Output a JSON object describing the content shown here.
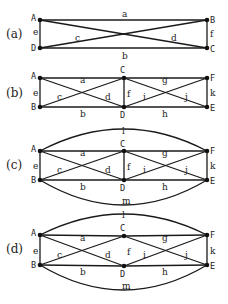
{
  "colors": {
    "stroke": "#1a1a1a",
    "node": "#111111",
    "text": "#222222",
    "background": "#ffffff"
  },
  "panels": [
    {
      "id": "a",
      "label": "(a)",
      "label_pos": [
        6,
        38
      ],
      "nodes": [
        {
          "name": "A",
          "x": 40,
          "y": 20,
          "lx": 31,
          "ly": 21
        },
        {
          "name": "B",
          "x": 207,
          "y": 20,
          "lx": 210,
          "ly": 23
        },
        {
          "name": "C",
          "x": 207,
          "y": 48,
          "lx": 210,
          "ly": 52
        },
        {
          "name": "D",
          "x": 40,
          "y": 48,
          "lx": 31,
          "ly": 51
        }
      ],
      "edges": [
        {
          "label": "a",
          "from": "A",
          "to": "B",
          "lx": 122,
          "ly": 17
        },
        {
          "label": "b",
          "from": "D",
          "to": "C",
          "lx": 122,
          "ly": 59
        },
        {
          "label": "c",
          "from": "D",
          "to": "B",
          "lx": 75,
          "ly": 41
        },
        {
          "label": "d",
          "from": "A",
          "to": "C",
          "lx": 171,
          "ly": 41
        },
        {
          "label": "e",
          "from": "A",
          "to": "D",
          "lx": 33,
          "ly": 35
        },
        {
          "label": "f",
          "from": "B",
          "to": "C",
          "lx": 210,
          "ly": 37
        }
      ]
    },
    {
      "id": "b",
      "label": "(b)",
      "label_pos": [
        6,
        97
      ],
      "nodes": [
        {
          "name": "A",
          "x": 40,
          "y": 78,
          "lx": 31,
          "ly": 79
        },
        {
          "name": "C",
          "x": 124,
          "y": 78,
          "lx": 120,
          "ly": 73
        },
        {
          "name": "F",
          "x": 207,
          "y": 78,
          "lx": 210,
          "ly": 81
        },
        {
          "name": "B",
          "x": 40,
          "y": 107,
          "lx": 31,
          "ly": 110
        },
        {
          "name": "D",
          "x": 124,
          "y": 107,
          "lx": 120,
          "ly": 118
        },
        {
          "name": "E",
          "x": 207,
          "y": 107,
          "lx": 210,
          "ly": 111
        }
      ],
      "edges": [
        {
          "label": "a",
          "from": "A",
          "to": "C",
          "lx": 80,
          "ly": 83
        },
        {
          "label": "b",
          "from": "B",
          "to": "D",
          "lx": 80,
          "ly": 117
        },
        {
          "label": "c",
          "from": "B",
          "to": "C",
          "lx": 57,
          "ly": 100
        },
        {
          "label": "d",
          "from": "A",
          "to": "D",
          "lx": 105,
          "ly": 100
        },
        {
          "label": "e",
          "from": "A",
          "to": "B",
          "lx": 33,
          "ly": 96
        },
        {
          "label": "f",
          "from": "C",
          "to": "D",
          "lx": 127,
          "ly": 97
        },
        {
          "label": "g",
          "from": "C",
          "to": "F",
          "lx": 162,
          "ly": 83
        },
        {
          "label": "h",
          "from": "D",
          "to": "E",
          "lx": 162,
          "ly": 117
        },
        {
          "label": "i",
          "from": "D",
          "to": "F",
          "lx": 143,
          "ly": 100
        },
        {
          "label": "j",
          "from": "C",
          "to": "E",
          "lx": 185,
          "ly": 100
        },
        {
          "label": "k",
          "from": "F",
          "to": "E",
          "lx": 210,
          "ly": 96
        }
      ]
    },
    {
      "id": "c",
      "label": "(c)",
      "label_pos": [
        6,
        169
      ],
      "arc_top": {
        "label": "l",
        "peak_y": 129,
        "lx": 122,
        "ly": 134
      },
      "arc_bottom": {
        "label": "m",
        "trough_y": 205,
        "lx": 122,
        "ly": 204
      },
      "nodes": [
        {
          "name": "A",
          "x": 40,
          "y": 151,
          "lx": 31,
          "ly": 152
        },
        {
          "name": "C",
          "x": 124,
          "y": 151,
          "lx": 120,
          "ly": 147
        },
        {
          "name": "F",
          "x": 207,
          "y": 151,
          "lx": 210,
          "ly": 154
        },
        {
          "name": "B",
          "x": 40,
          "y": 180,
          "lx": 31,
          "ly": 183
        },
        {
          "name": "D",
          "x": 124,
          "y": 180,
          "lx": 120,
          "ly": 191
        },
        {
          "name": "E",
          "x": 207,
          "y": 180,
          "lx": 210,
          "ly": 184
        }
      ],
      "edges": [
        {
          "label": "a",
          "from": "A",
          "to": "C",
          "lx": 80,
          "ly": 156
        },
        {
          "label": "b",
          "from": "B",
          "to": "D",
          "lx": 80,
          "ly": 190
        },
        {
          "label": "c",
          "from": "B",
          "to": "C",
          "lx": 57,
          "ly": 173
        },
        {
          "label": "d",
          "from": "A",
          "to": "D",
          "lx": 105,
          "ly": 173
        },
        {
          "label": "e",
          "from": "A",
          "to": "B",
          "lx": 33,
          "ly": 169
        },
        {
          "label": "f",
          "from": "C",
          "to": "D",
          "lx": 127,
          "ly": 170
        },
        {
          "label": "g",
          "from": "C",
          "to": "F",
          "lx": 162,
          "ly": 156
        },
        {
          "label": "h",
          "from": "D",
          "to": "E",
          "lx": 162,
          "ly": 190
        },
        {
          "label": "i",
          "from": "D",
          "to": "F",
          "lx": 143,
          "ly": 173
        },
        {
          "label": "j",
          "from": "C",
          "to": "E",
          "lx": 185,
          "ly": 173
        },
        {
          "label": "k",
          "from": "F",
          "to": "E",
          "lx": 210,
          "ly": 169
        }
      ]
    },
    {
      "id": "d",
      "label": "(d)",
      "label_pos": [
        6,
        253
      ],
      "arc_top": {
        "label": "l",
        "peak_y": 214,
        "lx": 122,
        "ly": 218
      },
      "arc_bottom": {
        "label": "m",
        "trough_y": 290,
        "lx": 122,
        "ly": 289
      },
      "nodes": [
        {
          "name": "A",
          "x": 40,
          "y": 235,
          "lx": 31,
          "ly": 236
        },
        {
          "name": "C",
          "x": 124,
          "y": 236,
          "lx": 120,
          "ly": 231
        },
        {
          "name": "F",
          "x": 207,
          "y": 235,
          "lx": 210,
          "ly": 238
        },
        {
          "name": "B",
          "x": 40,
          "y": 265,
          "lx": 31,
          "ly": 268
        },
        {
          "name": "D",
          "x": 124,
          "y": 266,
          "lx": 120,
          "ly": 277
        },
        {
          "name": "E",
          "x": 207,
          "y": 265,
          "lx": 210,
          "ly": 269
        }
      ],
      "edges": [
        {
          "label": "a",
          "from": "A",
          "to": "C",
          "lx": 80,
          "ly": 241
        },
        {
          "label": "b",
          "from": "B",
          "to": "D",
          "lx": 80,
          "ly": 275
        },
        {
          "label": "c",
          "from": "B",
          "to": "C",
          "lx": 57,
          "ly": 258
        },
        {
          "label": "d",
          "from": "A",
          "to": "D",
          "lx": 105,
          "ly": 258
        },
        {
          "label": "e",
          "from": "A",
          "to": "B",
          "lx": 33,
          "ly": 254
        },
        {
          "label": "f",
          "from": null,
          "to": null,
          "lx": 127,
          "ly": 255
        },
        {
          "label": "g",
          "from": "C",
          "to": "F",
          "lx": 162,
          "ly": 241
        },
        {
          "label": "h",
          "from": "D",
          "to": "E",
          "lx": 162,
          "ly": 275
        },
        {
          "label": "i",
          "from": "D",
          "to": "F",
          "lx": 143,
          "ly": 258
        },
        {
          "label": "j",
          "from": "C",
          "to": "E",
          "lx": 185,
          "ly": 258
        },
        {
          "label": "k",
          "from": "F",
          "to": "E",
          "lx": 210,
          "ly": 254
        }
      ]
    }
  ]
}
